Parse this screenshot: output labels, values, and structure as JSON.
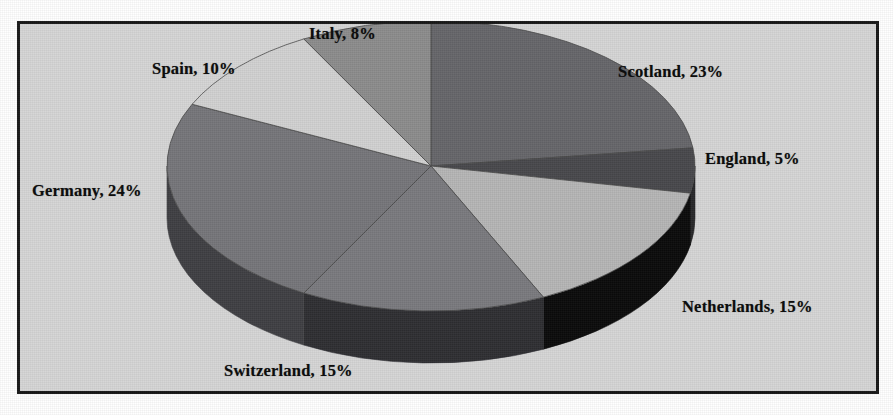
{
  "figure": {
    "background_color": "#d6d6d6",
    "border_color": "#181818",
    "label_color": "#0d0d0d"
  },
  "chart_data": {
    "type": "pie",
    "title": "",
    "subtitle": "",
    "xlabel": "",
    "ylabel": "",
    "legend_position": "none",
    "grid": false,
    "three_d": true,
    "start_angle_deg": 0,
    "direction": "clockwise",
    "categories": [
      "Scotland",
      "England",
      "Netherlands",
      "Switzerland",
      "Germany",
      "Spain",
      "Italy"
    ],
    "values": [
      23,
      5,
      15,
      15,
      24,
      10,
      8
    ],
    "unit": "%",
    "total": 100,
    "colors": [
      "#66666a",
      "#48484c",
      "#b6b6b6",
      "#7a7a7e",
      "#76767a",
      "#d2d2d2",
      "#8c8c8c"
    ],
    "side_colors": [
      "#3a3a3e",
      "#272729",
      "#0a0a0a",
      "#2e2e32",
      "#3f3f43",
      "#8f8f8f",
      "#5a5a5e"
    ],
    "slices": [
      {
        "label": "Scotland, 23%",
        "name": "Scotland",
        "value": 23,
        "color": "#66666a"
      },
      {
        "label": "England, 5%",
        "name": "England",
        "value": 5,
        "color": "#48484c"
      },
      {
        "label": "Netherlands, 15%",
        "name": "Netherlands",
        "value": 15,
        "color": "#b6b6b6"
      },
      {
        "label": "Switzerland, 15%",
        "name": "Switzerland",
        "value": 15,
        "color": "#7a7a7e"
      },
      {
        "label": "Germany, 24%",
        "name": "Germany",
        "value": 24,
        "color": "#76767a"
      },
      {
        "label": "Spain, 10%",
        "name": "Spain",
        "value": 10,
        "color": "#d2d2d2"
      },
      {
        "label": "Italy, 8%",
        "name": "Italy",
        "value": 8,
        "color": "#8c8c8c"
      }
    ]
  },
  "labels": {
    "italy": "Italy, 8%",
    "spain": "Spain, 10%",
    "scotland": "Scotland, 23%",
    "england": "England, 5%",
    "netherlands": "Netherlands, 15%",
    "switzerland": "Switzerland, 15%",
    "germany": "Germany, 24%"
  }
}
